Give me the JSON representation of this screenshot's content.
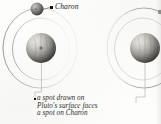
{
  "figure": {
    "type": "astronomy-diagram",
    "panels": [
      {
        "id": "left",
        "label_charon": "Charon",
        "caption_lines": [
          "a spot drawn on",
          "Pluto's surface faces",
          "a spot on Charon"
        ]
      },
      {
        "id": "right",
        "label_charon": "",
        "caption_lines": [
          "r",
          "a"
        ]
      }
    ],
    "colors": {
      "orbit_line": "#8d8b86",
      "orbit_line_faint": "#d7d5d0",
      "pluto_dark": "#3d3b38",
      "pluto_light": "#d8d6d1",
      "charon_dark": "#46433f",
      "charon_light": "#b4b1ab",
      "text": "#2b2a28",
      "background": "#fdfdfc"
    }
  }
}
